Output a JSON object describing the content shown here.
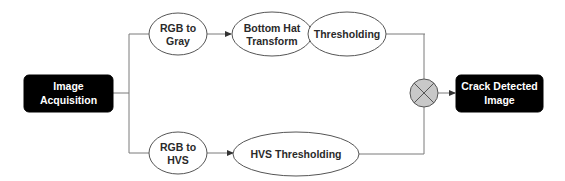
{
  "diagram": {
    "nodes": {
      "image_acquisition": {
        "lines": [
          "Image",
          "Acquisition"
        ],
        "shape": "rounded-rect",
        "fill": "#000000",
        "text_color": "#ffffff"
      },
      "rgb_to_gray": {
        "lines": [
          "RGB to",
          "Gray"
        ],
        "shape": "ellipse"
      },
      "bottom_hat": {
        "lines": [
          "Bottom Hat",
          "Transform"
        ],
        "shape": "ellipse"
      },
      "thresholding": {
        "lines": [
          "Thresholding"
        ],
        "shape": "ellipse"
      },
      "rgb_to_hvs": {
        "lines": [
          "RGB to",
          "HVS"
        ],
        "shape": "ellipse"
      },
      "hvs_thresholding": {
        "lines": [
          "HVS Thresholding"
        ],
        "shape": "ellipse"
      },
      "junction": {
        "symbol": "multiply-junction",
        "fill": "#c8c8c8"
      },
      "crack_detected": {
        "lines": [
          "Crack Detected",
          "Image"
        ],
        "shape": "rounded-rect",
        "fill": "#000000",
        "text_color": "#ffffff"
      }
    },
    "edges": [
      {
        "from": "image_acquisition",
        "to": "rgb_to_gray"
      },
      {
        "from": "image_acquisition",
        "to": "rgb_to_hvs"
      },
      {
        "from": "rgb_to_gray",
        "to": "bottom_hat",
        "arrow": true
      },
      {
        "from": "bottom_hat",
        "to": "thresholding",
        "arrow": true
      },
      {
        "from": "thresholding",
        "to": "junction"
      },
      {
        "from": "rgb_to_hvs",
        "to": "hvs_thresholding",
        "arrow": true
      },
      {
        "from": "hvs_thresholding",
        "to": "junction"
      },
      {
        "from": "junction",
        "to": "crack_detected",
        "arrow": true
      }
    ]
  }
}
